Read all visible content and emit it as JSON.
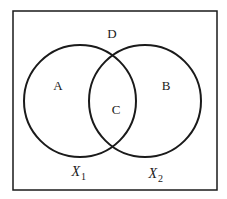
{
  "diagram": {
    "type": "venn",
    "universe_label": "D",
    "sets": [
      {
        "name": "X",
        "subscript": "1",
        "region_label": "A"
      },
      {
        "name": "X",
        "subscript": "2",
        "region_label": "B"
      }
    ],
    "intersection_label": "C",
    "colors": {
      "stroke": "#1a1a1a",
      "background": "#ffffff"
    }
  }
}
